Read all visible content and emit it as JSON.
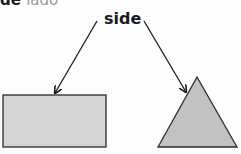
{
  "header": {
    "term_fragment": "de",
    "translation_fragment": "lado"
  },
  "diagram": {
    "label": "side",
    "shapes": [
      {
        "type": "rectangle",
        "fill": "#d5d5d5",
        "stroke": "#2a2a2a"
      },
      {
        "type": "triangle",
        "fill": "#c2c2c2",
        "stroke": "#2a2a2a"
      }
    ],
    "arrow_color": "#1a1a1a"
  }
}
